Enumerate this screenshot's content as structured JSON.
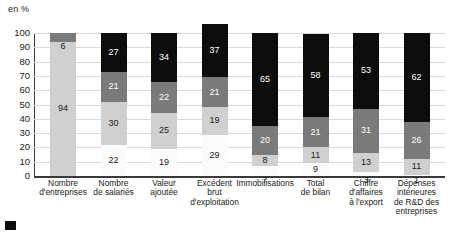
{
  "chart_data": {
    "type": "bar",
    "subtype": "stacked-100",
    "title": "",
    "xlabel": "",
    "ylabel": "en %",
    "ylim": [
      0,
      100
    ],
    "yticks": [
      100,
      90,
      80,
      70,
      60,
      50,
      40,
      30,
      20,
      10,
      0
    ],
    "grid": true,
    "legend": null,
    "series": [
      {
        "name": "level-1",
        "color": "#fbfbfb",
        "values": [
          null,
          22,
          19,
          29,
          7,
          9,
          3,
          1
        ]
      },
      {
        "name": "level-2",
        "color": "#d0d0d0",
        "values": [
          94,
          30,
          25,
          19,
          8,
          11,
          13,
          11
        ]
      },
      {
        "name": "level-3",
        "color": "#7a7a7a",
        "values": [
          6,
          21,
          22,
          21,
          20,
          21,
          31,
          26
        ]
      },
      {
        "name": "level-4",
        "color": "#0d0d0d",
        "values": [
          null,
          27,
          34,
          37,
          65,
          58,
          53,
          62
        ]
      }
    ],
    "categories": [
      {
        "lines": [
          "Nombre",
          "d'entreprises"
        ]
      },
      {
        "lines": [
          "Nombre",
          "de salariés"
        ]
      },
      {
        "lines": [
          "Valeur",
          "ajoutée"
        ]
      },
      {
        "lines": [
          "Excédent",
          "brut",
          "d'exploitation"
        ]
      },
      {
        "lines": [
          "Immobilisations"
        ]
      },
      {
        "lines": [
          "Total",
          "de bilan"
        ]
      },
      {
        "lines": [
          "Chiffre",
          "d'affaires",
          "à l'export"
        ]
      },
      {
        "lines": [
          "Dépenses",
          "intérieures",
          "de R&D des",
          "entreprises"
        ]
      }
    ],
    "bars": [
      {
        "category": "Nombre d'entreprises",
        "segments": [
          {
            "level": 1,
            "value": 94,
            "label": "94"
          },
          {
            "level": 2,
            "value": 6,
            "label": "6"
          }
        ]
      },
      {
        "category": "Nombre de salariés",
        "segments": [
          {
            "level": 0,
            "value": 22,
            "label": "22"
          },
          {
            "level": 1,
            "value": 30,
            "label": "30"
          },
          {
            "level": 2,
            "value": 21,
            "label": "21"
          },
          {
            "level": 3,
            "value": 27,
            "label": "27"
          }
        ]
      },
      {
        "category": "Valeur ajoutée",
        "segments": [
          {
            "level": 0,
            "value": 19,
            "label": "19"
          },
          {
            "level": 1,
            "value": 25,
            "label": "25"
          },
          {
            "level": 2,
            "value": 22,
            "label": "22"
          },
          {
            "level": 3,
            "value": 34,
            "label": "34"
          }
        ]
      },
      {
        "category": "Excédent brut d'exploitation",
        "segments": [
          {
            "level": 0,
            "value": 29,
            "label": "29"
          },
          {
            "level": 1,
            "value": 19,
            "label": "19"
          },
          {
            "level": 2,
            "value": 21,
            "label": "21"
          },
          {
            "level": 3,
            "value": 37,
            "label": "37"
          }
        ]
      },
      {
        "category": "Immobilisations",
        "segments": [
          {
            "level": 0,
            "value": 7,
            "label": "7"
          },
          {
            "level": 1,
            "value": 8,
            "label": "8"
          },
          {
            "level": 2,
            "value": 20,
            "label": "20"
          },
          {
            "level": 3,
            "value": 65,
            "label": "65"
          }
        ]
      },
      {
        "category": "Total de bilan",
        "segments": [
          {
            "level": 0,
            "value": 9,
            "label": "9"
          },
          {
            "level": 1,
            "value": 11,
            "label": "11"
          },
          {
            "level": 2,
            "value": 21,
            "label": "21"
          },
          {
            "level": 3,
            "value": 58,
            "label": "58"
          }
        ]
      },
      {
        "category": "Chiffre d'affaires à l'export",
        "segments": [
          {
            "level": 0,
            "value": 3,
            "label": "3"
          },
          {
            "level": 1,
            "value": 13,
            "label": "13"
          },
          {
            "level": 2,
            "value": 31,
            "label": "31"
          },
          {
            "level": 3,
            "value": 53,
            "label": "53"
          }
        ]
      },
      {
        "category": "Dépenses intérieures de R&D des entreprises",
        "segments": [
          {
            "level": 0,
            "value": 1,
            "label": "1"
          },
          {
            "level": 1,
            "value": 11,
            "label": "11"
          },
          {
            "level": 2,
            "value": 26,
            "label": "26"
          },
          {
            "level": 3,
            "value": 62,
            "label": "62"
          }
        ]
      }
    ]
  }
}
